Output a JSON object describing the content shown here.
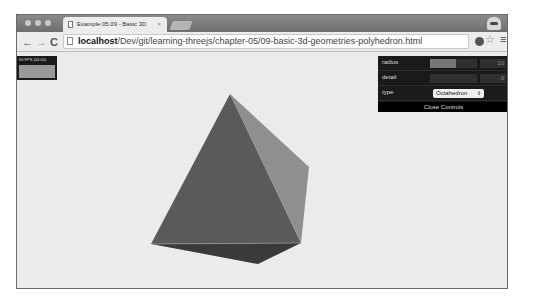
{
  "browser": {
    "tab": {
      "title": "Example 05.09 - Basic 3D",
      "close": "×"
    },
    "nav": {
      "back": "←",
      "forward": "→",
      "reload": "C"
    },
    "address": {
      "host": "localhost",
      "path": "/Dev/git/learning-threejs/chapter-05/09-basic-3d-geometries-polyhedron.html"
    },
    "icons": {
      "star": "☆",
      "menu": "≡",
      "pen": "/"
    }
  },
  "stats": {
    "fps_text": "60 FPS (44-60)"
  },
  "controls": {
    "rows": [
      {
        "label": "radius",
        "value": "10",
        "fill_pct": 55
      },
      {
        "label": "detail",
        "value": "0",
        "fill_pct": 0
      },
      {
        "label": "type",
        "select_value": "Octahedron"
      }
    ],
    "select_arrow": "⇕",
    "close_label": "Close Controls"
  },
  "scene": {
    "shape": "octahedron",
    "colors": {
      "front": "#5a5a5a",
      "right": "#8f8f8f",
      "bottom": "#3a3a3a",
      "background": "#ebebeb"
    }
  }
}
